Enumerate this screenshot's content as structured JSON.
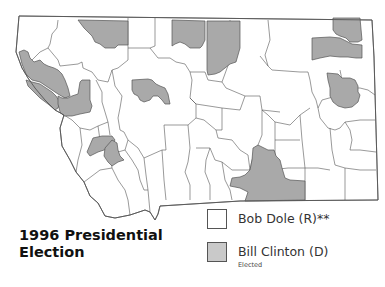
{
  "title": {
    "line1": "1996 Presidential",
    "line2": "Election"
  },
  "legend": {
    "items": [
      {
        "label": "Bob Dole (R)**",
        "sublabel": "",
        "color": "#ffffff"
      },
      {
        "label": "Bill Clinton (D)",
        "sublabel": "Elected",
        "color": "#a9a9a9"
      }
    ]
  },
  "colors": {
    "dole": "#ffffff",
    "clinton": "#a9a9a9",
    "border": "#555555"
  },
  "map": {
    "region": "Montana counties",
    "party_regions": [
      {
        "id": "nw-lincoln",
        "winner": "dole"
      },
      {
        "id": "flathead",
        "winner": "dole"
      },
      {
        "id": "glacier",
        "winner": "clinton"
      },
      {
        "id": "toole",
        "winner": "dole"
      },
      {
        "id": "liberty",
        "winner": "dole"
      },
      {
        "id": "hill",
        "winner": "clinton"
      },
      {
        "id": "blaine",
        "winner": "clinton"
      },
      {
        "id": "phillips",
        "winner": "dole"
      },
      {
        "id": "valley",
        "winner": "dole"
      },
      {
        "id": "daniels",
        "winner": "dole"
      },
      {
        "id": "sheridan",
        "winner": "clinton"
      },
      {
        "id": "roosevelt",
        "winner": "clinton"
      },
      {
        "id": "sanders",
        "winner": "clinton"
      },
      {
        "id": "lake",
        "winner": "dole"
      },
      {
        "id": "mineral",
        "winner": "clinton"
      },
      {
        "id": "missoula",
        "winner": "clinton"
      },
      {
        "id": "cascade",
        "winner": "clinton"
      },
      {
        "id": "richland",
        "winner": "dole"
      },
      {
        "id": "dawson",
        "winner": "clinton"
      },
      {
        "id": "deer-lodge",
        "winner": "clinton"
      },
      {
        "id": "silver-bow",
        "winner": "clinton"
      },
      {
        "id": "big-horn",
        "winner": "clinton"
      }
    ]
  }
}
